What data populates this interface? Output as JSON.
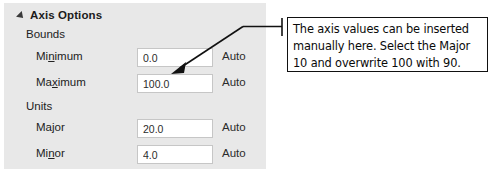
{
  "panel": {
    "section": {
      "title": "Axis Options",
      "disclosure_icon": "triangle-expanded-icon",
      "expanded": true
    },
    "groups": [
      {
        "label": "Bounds"
      },
      {
        "label": "Units"
      }
    ],
    "fields": [
      {
        "label_before": "Mi",
        "label_accel": "n",
        "label_after": "imum",
        "label_full": "Minimum",
        "value": "0.0",
        "auto_label": "Auto"
      },
      {
        "label_before": "Ma",
        "label_accel": "x",
        "label_after": "imum",
        "label_full": "Maximum",
        "value": "100.0",
        "auto_label": "Auto"
      },
      {
        "label_before": "Ma",
        "label_accel": "j",
        "label_after": "or",
        "label_full": "Major",
        "value": "20.0",
        "auto_label": "Auto"
      },
      {
        "label_before": "Mi",
        "label_accel": "n",
        "label_after": "or",
        "label_full": "Minor",
        "value": "4.0",
        "auto_label": "Auto"
      }
    ]
  },
  "annotation": {
    "text": "The axis values can be inserted manually here. Select the Major 10 and overwrite 100 with 90.",
    "points_to": "Maximum"
  },
  "colors": {
    "panel_background": "#e8e8e8",
    "input_background": "#ffffff",
    "input_border": "#c6c6c6",
    "text": "#222222",
    "annotation_border": "#111111",
    "leader_line": "#111111"
  }
}
